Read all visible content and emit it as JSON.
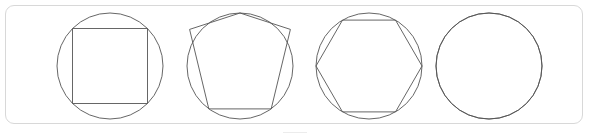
{
  "panel": {
    "name": "inscribed-polygons-figure-panel",
    "border_color": "#d8d8d8",
    "background_color": "#ffffff",
    "corner_radius": 9,
    "x": 5,
    "y": 5,
    "width": 578,
    "height": 119
  },
  "figure": {
    "title": "",
    "stroke_color": "#555555",
    "stroke_width": 0.9,
    "fill": "none",
    "panel_count": 4
  },
  "chart_data": {
    "type": "diagram",
    "title": "",
    "subtitle": "",
    "xlabel": "",
    "ylabel": "",
    "grid": false,
    "legend": "none",
    "canvas": {
      "width": 589,
      "height": 139
    },
    "panels": [
      {
        "index": 1,
        "label": "square-in-circle",
        "sides": 4,
        "circle": {
          "cx": 110,
          "cy": 66,
          "r": 53
        },
        "polygon_rotation_deg": -90,
        "vertex_offset_deg": 45,
        "vertices": [
          [
            72.5,
            28.5
          ],
          [
            147.5,
            28.5
          ],
          [
            147.5,
            103.5
          ],
          [
            72.5,
            103.5
          ]
        ]
      },
      {
        "index": 2,
        "label": "pentagon-in-circle",
        "sides": 5,
        "circle": {
          "cx": 240,
          "cy": 66,
          "r": 53
        },
        "polygon_rotation_deg": -90,
        "vertex_offset_deg": 0,
        "vertices": [
          [
            240,
            13
          ],
          [
            290.4,
            29.4
          ],
          [
            271.2,
            108.9
          ],
          [
            208.8,
            108.9
          ],
          [
            189.6,
            29.4
          ]
        ]
      },
      {
        "index": 3,
        "label": "hexagon-in-circle",
        "sides": 6,
        "circle": {
          "cx": 369,
          "cy": 66,
          "r": 53
        },
        "polygon_rotation_deg": 0,
        "vertex_offset_deg": 0,
        "vertices": [
          [
            422,
            66
          ],
          [
            395.5,
            111.9
          ],
          [
            342.5,
            111.9
          ],
          [
            316,
            66
          ],
          [
            342.5,
            20.1
          ],
          [
            395.5,
            20.1
          ]
        ]
      },
      {
        "index": 4,
        "label": "many-sided-polygon-in-circle",
        "sides": 32,
        "circle": {
          "cx": 489,
          "cy": 66,
          "r": 53
        },
        "polygon_rotation_deg": -90,
        "vertex_offset_deg": 0,
        "vertices": []
      }
    ]
  }
}
